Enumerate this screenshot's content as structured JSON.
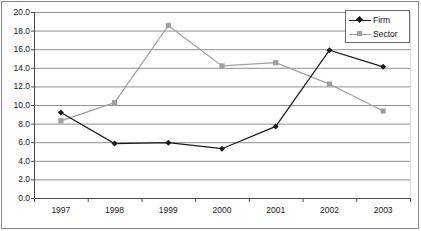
{
  "chart_data": {
    "type": "line",
    "title": "",
    "xlabel": "",
    "ylabel": "",
    "categories": [
      "1997",
      "1998",
      "1999",
      "2000",
      "2001",
      "2002",
      "2003"
    ],
    "x": [
      1997,
      1998,
      1999,
      2000,
      2001,
      2002,
      2003
    ],
    "series": [
      {
        "name": "Firm",
        "color": "#1a1a1a",
        "marker": "diamond",
        "values": [
          9.2,
          5.85,
          5.95,
          5.3,
          7.7,
          15.9,
          14.1
        ]
      },
      {
        "name": "Sector",
        "color": "#a0a0a0",
        "marker": "square",
        "values": [
          8.3,
          10.25,
          18.55,
          14.2,
          14.55,
          12.25,
          9.35
        ]
      }
    ],
    "ylim": [
      0.0,
      20.0
    ],
    "yticks": [
      0.0,
      2.0,
      4.0,
      6.0,
      8.0,
      10.0,
      12.0,
      14.0,
      16.0,
      18.0,
      20.0
    ],
    "ytick_labels": [
      "0.0",
      "2.0",
      "4.0",
      "6.0",
      "8.0",
      "10.0",
      "12.0",
      "14.0",
      "16.0",
      "18.0",
      "20.0"
    ],
    "grid": true,
    "grid_axis": "y",
    "legend_position": "top-right",
    "legend_entries": [
      "Firm",
      "Sector"
    ]
  },
  "legend": {
    "entries": [
      {
        "label": "Firm"
      },
      {
        "label": "Sector"
      }
    ]
  },
  "axes": {
    "y_labels": [
      "20.0",
      "18.0",
      "16.0",
      "14.0",
      "12.0",
      "10.0",
      "8.0",
      "6.0",
      "4.0",
      "2.0",
      "0.0"
    ],
    "x_labels": [
      "1997",
      "1998",
      "1999",
      "2000",
      "2001",
      "2002",
      "2003"
    ]
  },
  "colors": {
    "firm": "#1a1a1a",
    "sector": "#a0a0a0",
    "grid": "#8f8f8f",
    "axis": "#4d4d4d",
    "frame": "#8a8a8a",
    "background": "#ffffff"
  }
}
